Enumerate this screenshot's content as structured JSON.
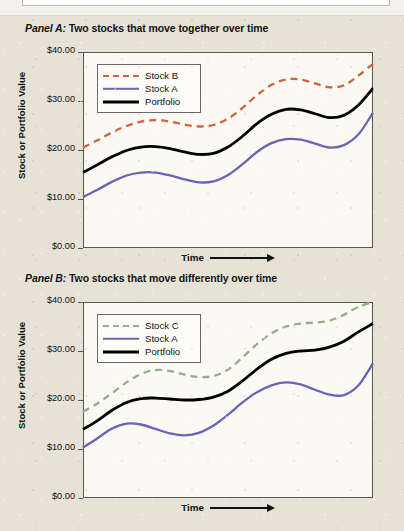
{
  "page": {
    "background_color": "#e6e2d6",
    "plot_background_color": "#fbf9f4"
  },
  "colors": {
    "stock_b": "#d4603f",
    "stock_a": "#6b63b5",
    "stock_c": "#9aab8a",
    "portfolio": "#000000",
    "axis": "#575754"
  },
  "panels": [
    {
      "id": "panel-a",
      "label": "Panel A:",
      "title": "Two stocks that move together over time",
      "ylabel": "Stock or Portfolio Value",
      "xlabel": "Time",
      "yticks": [
        "$40.00",
        "$30.00",
        "$20.00",
        "$10.00",
        "$0.00"
      ],
      "legend": [
        {
          "label": "Stock B",
          "style": "dashed",
          "color_key": "stock_b"
        },
        {
          "label": "Stock A",
          "style": "solid",
          "color_key": "stock_a"
        },
        {
          "label": "Portfolio",
          "style": "solid",
          "color_key": "portfolio"
        }
      ]
    },
    {
      "id": "panel-b",
      "label": "Panel B:",
      "title": "Two stocks that move differently over time",
      "ylabel": "Stock or Portfolio Value",
      "xlabel": "Time",
      "yticks": [
        "$40.00",
        "$30.00",
        "$20.00",
        "$10.00",
        "$0.00"
      ],
      "legend": [
        {
          "label": "Stock C",
          "style": "dashed",
          "color_key": "stock_c"
        },
        {
          "label": "Stock A",
          "style": "solid",
          "color_key": "stock_a"
        },
        {
          "label": "Portfolio",
          "style": "solid",
          "color_key": "portfolio"
        }
      ]
    }
  ],
  "chart_data": [
    {
      "type": "line",
      "title": "Panel A: Two stocks that move together over time",
      "xlabel": "Time",
      "ylabel": "Stock or Portfolio Value",
      "ylim": [
        0,
        40
      ],
      "yticks": [
        0,
        10,
        20,
        30,
        40
      ],
      "ytick_labels": [
        "$0.00",
        "$10.00",
        "$20.00",
        "$30.00",
        "$40.00"
      ],
      "xlim": [
        0,
        100
      ],
      "grid": false,
      "legend_position": "top-left-inside",
      "x": [
        0,
        5,
        10,
        15,
        20,
        25,
        30,
        35,
        40,
        45,
        50,
        55,
        60,
        65,
        70,
        75,
        80,
        85,
        90,
        95,
        100
      ],
      "series": [
        {
          "name": "Stock B",
          "style": "dashed",
          "color": "#d4603f",
          "values": [
            20.5,
            22.0,
            23.6,
            24.9,
            25.8,
            26.1,
            25.8,
            25.2,
            24.8,
            25.1,
            26.4,
            28.6,
            31.2,
            33.3,
            34.4,
            34.4,
            33.6,
            32.8,
            33.2,
            35.2,
            37.6
          ]
        },
        {
          "name": "Stock A",
          "style": "solid",
          "color": "#6b63b5",
          "values": [
            10.4,
            11.9,
            13.5,
            14.8,
            15.4,
            15.4,
            14.8,
            14.0,
            13.4,
            13.6,
            14.9,
            17.1,
            19.6,
            21.4,
            22.2,
            22.1,
            21.3,
            20.5,
            21.0,
            23.2,
            27.6
          ]
        },
        {
          "name": "Portfolio",
          "style": "solid",
          "color": "#000000",
          "values": [
            15.4,
            17.0,
            18.6,
            19.9,
            20.6,
            20.7,
            20.3,
            19.6,
            19.1,
            19.3,
            20.6,
            22.8,
            25.4,
            27.3,
            28.3,
            28.2,
            27.4,
            26.6,
            27.1,
            29.2,
            32.6
          ]
        }
      ]
    },
    {
      "type": "line",
      "title": "Panel B: Two stocks that move differently over time",
      "xlabel": "Time",
      "ylabel": "Stock or Portfolio Value",
      "ylim": [
        0,
        40
      ],
      "yticks": [
        0,
        10,
        20,
        30,
        40
      ],
      "ytick_labels": [
        "$0.00",
        "$10.00",
        "$20.00",
        "$30.00",
        "$40.00"
      ],
      "xlim": [
        0,
        100
      ],
      "grid": false,
      "legend_position": "top-left-inside",
      "x": [
        0,
        5,
        10,
        15,
        20,
        25,
        30,
        35,
        40,
        45,
        50,
        55,
        60,
        65,
        70,
        75,
        80,
        85,
        90,
        95,
        100
      ],
      "series": [
        {
          "name": "Stock C",
          "style": "dashed",
          "color": "#9aab8a",
          "values": [
            17.6,
            19.3,
            21.4,
            23.6,
            25.3,
            26.1,
            25.9,
            25.2,
            24.7,
            24.9,
            26.2,
            28.7,
            31.4,
            33.6,
            35.0,
            35.6,
            35.8,
            36.2,
            37.4,
            39.0,
            40.0
          ]
        },
        {
          "name": "Stock A",
          "style": "solid",
          "color": "#6b63b5",
          "values": [
            10.3,
            12.2,
            14.2,
            15.2,
            15.0,
            14.1,
            13.2,
            12.8,
            13.3,
            14.8,
            17.0,
            19.5,
            21.6,
            23.0,
            23.6,
            23.2,
            22.1,
            21.1,
            21.0,
            23.0,
            27.5
          ]
        },
        {
          "name": "Portfolio",
          "style": "solid",
          "color": "#000000",
          "values": [
            14.0,
            15.8,
            17.9,
            19.5,
            20.3,
            20.4,
            20.2,
            20.0,
            20.1,
            20.6,
            21.8,
            23.9,
            26.3,
            28.3,
            29.5,
            30.0,
            30.2,
            30.8,
            32.0,
            33.9,
            35.6
          ]
        }
      ]
    }
  ]
}
